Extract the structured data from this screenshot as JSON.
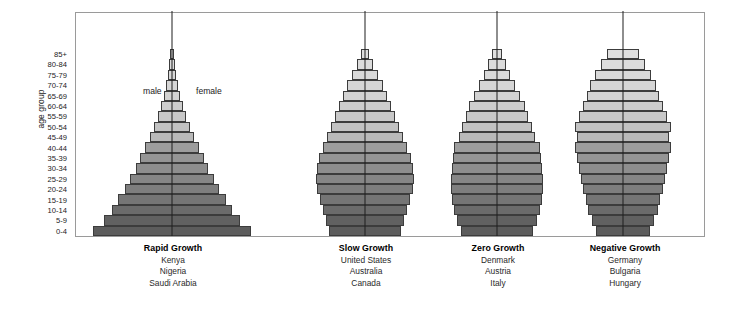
{
  "figure": {
    "axis_title": "age group",
    "male_label": "male",
    "female_label": "female",
    "frame_color": "#9a9a9a",
    "axis_line_color": "#1e1e1e",
    "bar_outline_color": "#3c3c3c",
    "background": "#ffffff"
  },
  "chart_data": {
    "type": "bar",
    "subtype": "population-pyramid",
    "title": "",
    "xlabel": "",
    "ylabel": "age group",
    "grid": false,
    "legend_position": "inline-top-left",
    "categories": [
      "0-4",
      "5-9",
      "10-14",
      "15-19",
      "20-24",
      "25-29",
      "30-34",
      "35-39",
      "40-44",
      "45-49",
      "50-54",
      "55-59",
      "60-64",
      "65-69",
      "70-74",
      "75-79",
      "80-84",
      "85+"
    ],
    "tick_labels_top_to_bottom": [
      "85+",
      "80-84",
      "75-79",
      "70-74",
      "65-69",
      "60-64",
      "55-59",
      "50-54",
      "45-49",
      "40-44",
      "35-39",
      "30-34",
      "25-29",
      "20-24",
      "15-19",
      "10-14",
      "5-9",
      "0-4"
    ],
    "band_colors_bottom_to_top": [
      "#5c5c5c",
      "#616161",
      "#6b6b6b",
      "#757575",
      "#7e7e7e",
      "#868686",
      "#8e8e8e",
      "#959595",
      "#9d9d9d",
      "#b9b9b9",
      "#c2c2c2",
      "#c8c8c8",
      "#cdcdcd",
      "#d2d2d2",
      "#d6d6d6",
      "#d9d9d9",
      "#dcdcdc",
      "#dfdfdf"
    ],
    "series": [
      {
        "name": "Rapid Growth",
        "countries": [
          "Kenya",
          "Nigeria",
          "Saudi Arabia"
        ],
        "half_width_pct_bottom_to_top": [
          100,
          86,
          76,
          68,
          60,
          53,
          46,
          40,
          34,
          28,
          23,
          18,
          14,
          10,
          7.5,
          5.5,
          4,
          2.6
        ]
      },
      {
        "name": "Slow Growth",
        "countries": [
          "United States",
          "Australia",
          "Canada"
        ],
        "half_width_pct_bottom_to_top": [
          74,
          80,
          86,
          92,
          98,
          100,
          97,
          93,
          86,
          78,
          70,
          62,
          54,
          45,
          36,
          26,
          17,
          9
        ]
      },
      {
        "name": "Zero Growth",
        "countries": [
          "Denmark",
          "Austria",
          "Italy"
        ],
        "half_width_pct_bottom_to_top": [
          78,
          86,
          94,
          98,
          100,
          99,
          97,
          96,
          94,
          83,
          76,
          68,
          60,
          50,
          40,
          29,
          19,
          10
        ]
      },
      {
        "name": "Negative Growth",
        "countries": [
          "Germany",
          "Bulgaria",
          "Hungary"
        ],
        "half_width_pct_bottom_to_top": [
          56,
          64,
          72,
          78,
          84,
          88,
          92,
          96,
          100,
          96,
          100,
          92,
          84,
          76,
          68,
          58,
          46,
          34
        ]
      }
    ]
  },
  "captions": [
    {
      "title": "Rapid Growth",
      "countries": [
        "Kenya",
        "Nigeria",
        "Saudi Arabia"
      ]
    },
    {
      "title": "Slow Growth",
      "countries": [
        "United States",
        "Australia",
        "Canada"
      ]
    },
    {
      "title": "Zero Growth",
      "countries": [
        "Denmark",
        "Austria",
        "Italy"
      ]
    },
    {
      "title": "Negative Growth",
      "countries": [
        "Germany",
        "Bulgaria",
        "Hungary"
      ]
    }
  ],
  "layout": {
    "pyramids": [
      {
        "left": 93,
        "width": 158,
        "caption_left": 97,
        "caption_width": 152
      },
      {
        "left": 316,
        "width": 98,
        "caption_left": 296,
        "caption_width": 140
      },
      {
        "left": 451,
        "width": 92,
        "caption_left": 428,
        "caption_width": 140
      },
      {
        "left": 575,
        "width": 96,
        "caption_left": 555,
        "caption_width": 140
      }
    ],
    "male_label_pos": {
      "left": 143,
      "top": 86
    },
    "female_label_pos": {
      "left": 196,
      "top": 86
    }
  }
}
